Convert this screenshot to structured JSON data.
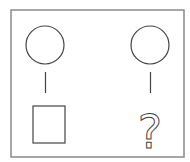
{
  "diagram": {
    "left": {
      "top_shape": "circle",
      "bottom_shape": "square"
    },
    "right": {
      "top_shape": "circle",
      "bottom_shape": "unknown",
      "unknown_label": "?"
    },
    "stroke_color": "#444444",
    "frame_color": "#888888"
  }
}
